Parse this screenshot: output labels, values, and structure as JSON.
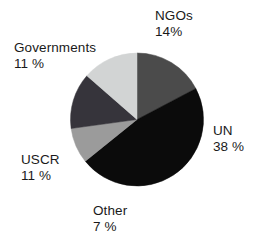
{
  "chart_data": {
    "type": "pie",
    "title": "",
    "categories": [
      "UN",
      "NGOs",
      "Governments",
      "USCR",
      "Other"
    ],
    "values": [
      38,
      14,
      11,
      11,
      7
    ],
    "value_suffix": "%",
    "legend": "none",
    "labels_position": "outside-callout",
    "slice_order_clockwise_from_12": [
      "NGOs",
      "UN",
      "Other",
      "USCR",
      "Governments"
    ],
    "colors": [
      "#0b0b0b",
      "#4b4b4b",
      "#d2d4d4",
      "#36343b",
      "#9b9b9b"
    ],
    "slices": [
      {
        "name": "UN",
        "value": 38,
        "label": "UN",
        "pct_text": "38 %",
        "color": "#0b0b0b"
      },
      {
        "name": "NGOs",
        "value": 14,
        "label": "NGOs",
        "pct_text": "14%",
        "color": "#4b4b4b"
      },
      {
        "name": "Governments",
        "value": 11,
        "label": "Governments",
        "pct_text": "11 %",
        "color": "#d2d4d4"
      },
      {
        "name": "USCR",
        "value": 11,
        "label": "USCR",
        "pct_text": "11 %",
        "color": "#36343b"
      },
      {
        "name": "Other",
        "value": 7,
        "label": "Other",
        "pct_text": "7 %",
        "color": "#9b9b9b"
      }
    ]
  },
  "labels": {
    "ngos": {
      "name": "NGOs",
      "pct": "14%"
    },
    "governments": {
      "name": "Governments",
      "pct": "11 %"
    },
    "un": {
      "name": "UN",
      "pct": "38 %"
    },
    "uscr": {
      "name": "USCR",
      "pct": "11 %"
    },
    "other": {
      "name": "Other",
      "pct": "7 %"
    }
  }
}
